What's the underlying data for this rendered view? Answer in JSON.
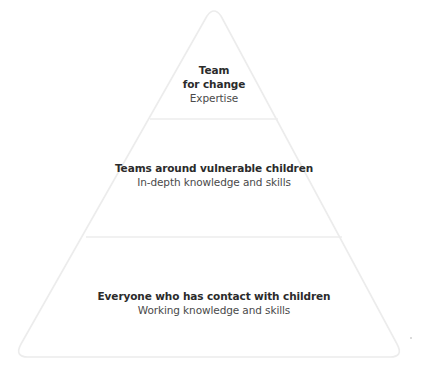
{
  "diagram": {
    "type": "pyramid",
    "colors": {
      "outline": "#ececec",
      "fill": "#ffffff",
      "title_text": "#2b2b2b",
      "subtitle_text": "#4a4a4a"
    },
    "tiers": [
      {
        "level": "top",
        "title_line1": "Team",
        "title_line2": "for change",
        "subtitle": "Expertise"
      },
      {
        "level": "middle",
        "title": "Teams around vulnerable children",
        "subtitle": "In-depth knowledge and skills"
      },
      {
        "level": "bottom",
        "title": "Everyone who has contact with children",
        "subtitle": "Working knowledge and skills"
      }
    ]
  }
}
